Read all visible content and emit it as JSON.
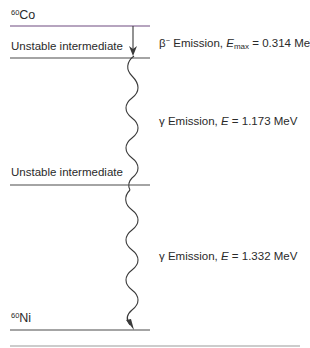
{
  "diagram": {
    "levels": [
      {
        "id": "co60",
        "label_sup": "60",
        "label_main": "Co",
        "y": 26,
        "color": "#7a4a8a"
      },
      {
        "id": "intermediate1",
        "label": "Unstable intermediate",
        "y": 58,
        "color": "#4a4a4a"
      },
      {
        "id": "intermediate2",
        "label": "Unstable intermediate",
        "y": 185,
        "color": "#4a4a4a"
      },
      {
        "id": "ni60",
        "label_sup": "60",
        "label_main": "Ni",
        "y": 330,
        "color": "#4a4a4a"
      }
    ],
    "transitions": [
      {
        "type": "beta",
        "prefix": "β",
        "prefix_sup": "−",
        "text": " Emission, ",
        "var": "E",
        "var_sub": "max",
        "value": " = 0.314 MeV"
      },
      {
        "type": "gamma",
        "prefix": "γ",
        "text": " Emission, ",
        "var": "E",
        "value": " = 1.173 MeV"
      },
      {
        "type": "gamma",
        "prefix": "γ",
        "text": " Emission, ",
        "var": "E",
        "value": " = 1.332 MeV"
      }
    ],
    "bottom_rule_color": "#9a9a9a"
  }
}
